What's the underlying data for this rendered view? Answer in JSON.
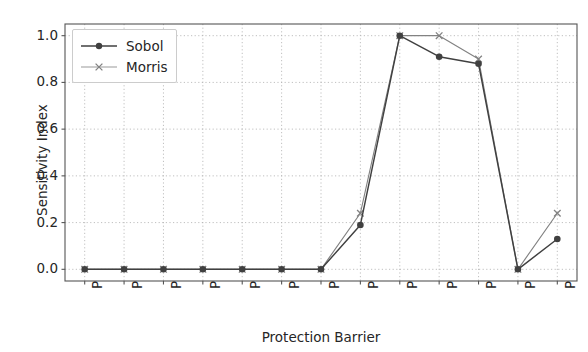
{
  "chart_data": {
    "type": "line",
    "title": "",
    "xlabel": "Protection Barrier",
    "ylabel": "Sensitivity Index",
    "categories": [
      "PB1",
      "PB2",
      "PB3",
      "PB4",
      "PB5",
      "PB6",
      "PB7",
      "PB8",
      "PB9",
      "PB10",
      "PB11",
      "PB12",
      "PB13"
    ],
    "series": [
      {
        "name": "Sobol",
        "values": [
          0.0,
          0.0,
          0.0,
          0.0,
          0.0,
          0.0,
          0.0,
          0.19,
          1.0,
          0.91,
          0.88,
          0.0,
          0.13
        ],
        "color": "#404040",
        "marker": "circle"
      },
      {
        "name": "Morris",
        "values": [
          0.0,
          0.0,
          0.0,
          0.0,
          0.0,
          0.0,
          0.0,
          0.24,
          1.0,
          1.0,
          0.9,
          0.0,
          0.24
        ],
        "color": "#828282",
        "marker": "x"
      }
    ],
    "ylim": [
      -0.05,
      1.05
    ],
    "yticks": [
      0.0,
      0.2,
      0.4,
      0.6,
      0.8,
      1.0
    ],
    "ytick_labels": [
      "0.0",
      "0.2",
      "0.4",
      "0.6",
      "0.8",
      "1.0"
    ],
    "grid": true,
    "grid_color": "#b0b0b0",
    "legend_position": "upper left",
    "xtick_rotation": 90
  },
  "legend": {
    "entries": [
      {
        "label": "Sobol"
      },
      {
        "label": "Morris"
      }
    ]
  }
}
